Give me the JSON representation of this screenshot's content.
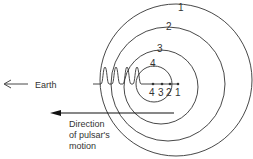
{
  "diagram": {
    "wavefront_labels": [
      "1",
      "2",
      "3",
      "4"
    ],
    "position_labels": [
      "4",
      "3",
      "2",
      "1"
    ],
    "earth_label": "Earth",
    "motion_label_line1": "Direction",
    "motion_label_line2": "of pulsar's",
    "motion_label_line3": "motion",
    "colors": {
      "stroke": "#333333",
      "background": "#ffffff"
    }
  }
}
